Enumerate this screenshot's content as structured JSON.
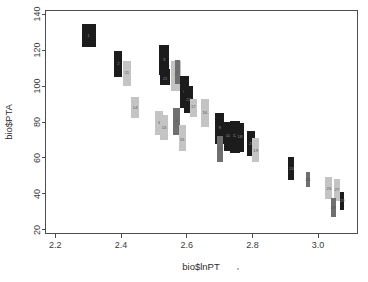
{
  "chart_data": {
    "type": "scatter",
    "title": "",
    "xlabel": "bio$lnPT",
    "ylabel": "bio$PTA",
    "xlim": [
      2.17,
      3.12
    ],
    "ylim": [
      18,
      142
    ],
    "xticks": [
      2.2,
      2.4,
      2.6,
      2.8,
      3.0
    ],
    "xtick_labels": [
      "2.2",
      "2.4",
      "2.6",
      "2.8",
      "3.0"
    ],
    "yticks": [
      20,
      40,
      60,
      80,
      100,
      120,
      140
    ],
    "ytick_labels": [
      "20",
      "40",
      "60",
      "80",
      "100",
      "120",
      "140"
    ],
    "grid": false,
    "legend": null,
    "marker_style": "vertical-bar-with-id-label",
    "colors": {
      "dark": "#1c1c1c",
      "light": "#c4c4c4",
      "mid": "#6f6f6f",
      "axis": "#4d4d4d",
      "background": "#ffffff"
    },
    "points": [
      {
        "id": "1",
        "x": 2.301,
        "y": 128.0,
        "ylow": 121.5,
        "yhigh": 134.5,
        "shade": "dark",
        "width": 14
      },
      {
        "id": "2",
        "x": 2.392,
        "y": 112.5,
        "ylow": 105.0,
        "yhigh": 119.5,
        "shade": "dark",
        "width": 8
      },
      {
        "id": "11",
        "x": 2.418,
        "y": 107.5,
        "ylow": 100.0,
        "yhigh": 114.0,
        "shade": "light",
        "width": 8
      },
      {
        "id": "14",
        "x": 2.443,
        "y": 88.0,
        "ylow": 82.0,
        "yhigh": 94.0,
        "shade": "light",
        "width": 8
      },
      {
        "id": "6",
        "x": 2.517,
        "y": 79.5,
        "ylow": 73.0,
        "yhigh": 86.0,
        "shade": "light",
        "width": 8
      },
      {
        "id": "13",
        "x": 2.531,
        "y": 77.0,
        "ylow": 70.0,
        "yhigh": 84.0,
        "shade": "light",
        "width": 8
      },
      {
        "id": "3",
        "x": 2.531,
        "y": 114.5,
        "ylow": 106.0,
        "yhigh": 123.0,
        "shade": "dark",
        "width": 10
      },
      {
        "id": "21",
        "x": 2.534,
        "y": 104.0,
        "ylow": 100.5,
        "yhigh": 109.5,
        "shade": "dark",
        "width": 10
      },
      {
        "id": "5",
        "x": 2.566,
        "y": 106.0,
        "ylow": 97.0,
        "yhigh": 114.0,
        "shade": "light",
        "width": 10
      },
      {
        "id": "7",
        "x": 2.571,
        "y": 107.5,
        "ylow": 101.0,
        "yhigh": 114.5,
        "shade": "mid",
        "width": 5
      },
      {
        "id": "4",
        "x": 2.569,
        "y": 80.5,
        "ylow": 73.0,
        "yhigh": 88.0,
        "shade": "mid",
        "width": 7
      },
      {
        "id": "15",
        "x": 2.586,
        "y": 70.0,
        "ylow": 64.0,
        "yhigh": 78.5,
        "shade": "light",
        "width": 7
      },
      {
        "id": "8",
        "x": 2.593,
        "y": 97.0,
        "ylow": 88.0,
        "yhigh": 105.5,
        "shade": "dark",
        "width": 9
      },
      {
        "id": "22",
        "x": 2.606,
        "y": 92.5,
        "ylow": 85.0,
        "yhigh": 100.0,
        "shade": "dark",
        "width": 9
      },
      {
        "id": "17",
        "x": 2.62,
        "y": 88.5,
        "ylow": 83.0,
        "yhigh": 93.0,
        "shade": "light",
        "width": 7
      },
      {
        "id": "16",
        "x": 2.655,
        "y": 85.0,
        "ylow": 77.0,
        "yhigh": 93.0,
        "shade": "light",
        "width": 8
      },
      {
        "id": "9",
        "x": 2.7,
        "y": 76.5,
        "ylow": 68.0,
        "yhigh": 85.0,
        "shade": "dark",
        "width": 9
      },
      {
        "id": "23",
        "x": 2.702,
        "y": 65.0,
        "ylow": 58.0,
        "yhigh": 72.0,
        "shade": "mid",
        "width": 6
      },
      {
        "id": "10",
        "x": 2.726,
        "y": 72.5,
        "ylow": 64.0,
        "yhigh": 80.0,
        "shade": "dark",
        "width": 9
      },
      {
        "id": "12",
        "x": 2.747,
        "y": 72.0,
        "ylow": 63.0,
        "yhigh": 80.5,
        "shade": "dark",
        "width": 10
      },
      {
        "id": "18",
        "x": 2.762,
        "y": 71.5,
        "ylow": 63.5,
        "yhigh": 79.5,
        "shade": "dark",
        "width": 8
      },
      {
        "id": "20",
        "x": 2.797,
        "y": 68.0,
        "ylow": 61.0,
        "yhigh": 75.0,
        "shade": "dark",
        "width": 8
      },
      {
        "id": "19",
        "x": 2.81,
        "y": 64.0,
        "ylow": 57.5,
        "yhigh": 71.0,
        "shade": "light",
        "width": 7
      },
      {
        "id": "24",
        "x": 2.919,
        "y": 54.0,
        "ylow": 48.0,
        "yhigh": 60.5,
        "shade": "dark",
        "width": 6
      },
      {
        "id": "25",
        "x": 2.969,
        "y": 48.0,
        "ylow": 44.0,
        "yhigh": 52.0,
        "shade": "mid",
        "width": 4
      },
      {
        "id": "26",
        "x": 3.033,
        "y": 43.0,
        "ylow": 37.0,
        "yhigh": 49.5,
        "shade": "light",
        "width": 7
      },
      {
        "id": "27",
        "x": 3.057,
        "y": 42.0,
        "ylow": 36.0,
        "yhigh": 48.5,
        "shade": "light",
        "width": 6
      },
      {
        "id": "28",
        "x": 3.046,
        "y": 32.0,
        "ylow": 27.0,
        "yhigh": 37.5,
        "shade": "mid",
        "width": 5
      },
      {
        "id": "29",
        "x": 3.074,
        "y": 36.0,
        "ylow": 31.0,
        "yhigh": 41.0,
        "shade": "dark",
        "width": 4
      }
    ]
  },
  "figure": {
    "x_axis_title": "bio$lnPT",
    "y_axis_title": "bio$PTA"
  }
}
